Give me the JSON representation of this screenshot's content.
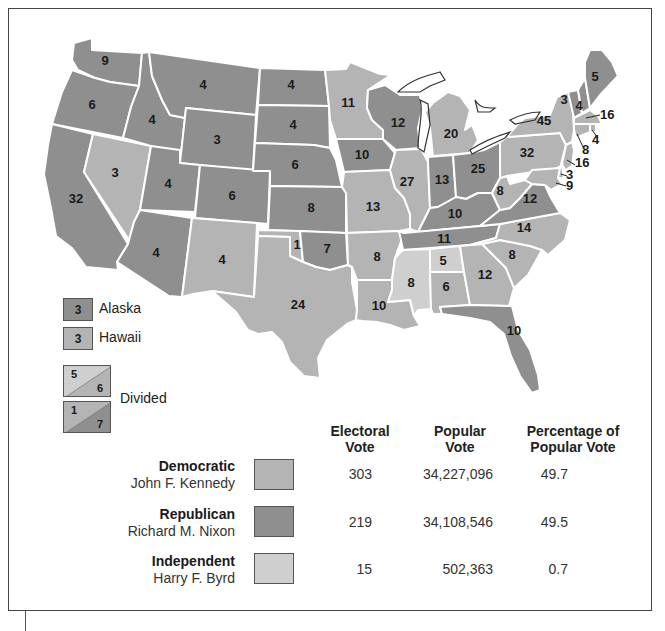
{
  "colors": {
    "democratic": "#b4b4b4",
    "republican": "#8f8f8f",
    "independent": "#d0d0d0",
    "border": "#ffffff",
    "outline": "#333333"
  },
  "map": {
    "states": [
      {
        "abbr": "WA",
        "ev": "9",
        "party": "republican"
      },
      {
        "abbr": "OR",
        "ev": "6",
        "party": "republican"
      },
      {
        "abbr": "CA",
        "ev": "32",
        "party": "republican"
      },
      {
        "abbr": "NV",
        "ev": "3",
        "party": "democratic"
      },
      {
        "abbr": "ID",
        "ev": "4",
        "party": "republican"
      },
      {
        "abbr": "MT",
        "ev": "4",
        "party": "republican"
      },
      {
        "abbr": "WY",
        "ev": "3",
        "party": "republican"
      },
      {
        "abbr": "UT",
        "ev": "4",
        "party": "republican"
      },
      {
        "abbr": "AZ",
        "ev": "4",
        "party": "republican"
      },
      {
        "abbr": "CO",
        "ev": "6",
        "party": "republican"
      },
      {
        "abbr": "NM",
        "ev": "4",
        "party": "democratic"
      },
      {
        "abbr": "ND",
        "ev": "4",
        "party": "republican"
      },
      {
        "abbr": "SD",
        "ev": "4",
        "party": "republican"
      },
      {
        "abbr": "NE",
        "ev": "6",
        "party": "republican"
      },
      {
        "abbr": "KS",
        "ev": "8",
        "party": "republican"
      },
      {
        "abbr": "OK",
        "ev": "7",
        "party": "republican",
        "split": "1"
      },
      {
        "abbr": "TX",
        "ev": "24",
        "party": "democratic"
      },
      {
        "abbr": "MN",
        "ev": "11",
        "party": "democratic"
      },
      {
        "abbr": "IA",
        "ev": "10",
        "party": "republican"
      },
      {
        "abbr": "MO",
        "ev": "13",
        "party": "democratic"
      },
      {
        "abbr": "AR",
        "ev": "8",
        "party": "democratic"
      },
      {
        "abbr": "LA",
        "ev": "10",
        "party": "democratic"
      },
      {
        "abbr": "WI",
        "ev": "12",
        "party": "republican"
      },
      {
        "abbr": "IL",
        "ev": "27",
        "party": "democratic"
      },
      {
        "abbr": "MI",
        "ev": "20",
        "party": "democratic"
      },
      {
        "abbr": "IN",
        "ev": "13",
        "party": "republican"
      },
      {
        "abbr": "OH",
        "ev": "25",
        "party": "republican"
      },
      {
        "abbr": "KY",
        "ev": "10",
        "party": "republican"
      },
      {
        "abbr": "TN",
        "ev": "11",
        "party": "republican"
      },
      {
        "abbr": "MS",
        "ev": "8",
        "party": "independent"
      },
      {
        "abbr": "AL",
        "ev": "5/6",
        "party": "divided"
      },
      {
        "abbr": "GA",
        "ev": "12",
        "party": "democratic"
      },
      {
        "abbr": "FL",
        "ev": "10",
        "party": "republican"
      },
      {
        "abbr": "SC",
        "ev": "8",
        "party": "democratic"
      },
      {
        "abbr": "NC",
        "ev": "14",
        "party": "democratic"
      },
      {
        "abbr": "VA",
        "ev": "12",
        "party": "republican"
      },
      {
        "abbr": "WV",
        "ev": "8",
        "party": "democratic"
      },
      {
        "abbr": "PA",
        "ev": "32",
        "party": "democratic"
      },
      {
        "abbr": "NY",
        "ev": "45",
        "party": "democratic"
      },
      {
        "abbr": "VT",
        "ev": "3",
        "party": "republican"
      },
      {
        "abbr": "NH",
        "ev": "4",
        "party": "republican"
      },
      {
        "abbr": "ME",
        "ev": "5",
        "party": "republican"
      },
      {
        "abbr": "MA",
        "ev": "16",
        "party": "democratic"
      },
      {
        "abbr": "RI",
        "ev": "4",
        "party": "democratic"
      },
      {
        "abbr": "CT",
        "ev": "8",
        "party": "democratic"
      },
      {
        "abbr": "NJ",
        "ev": "16",
        "party": "democratic"
      },
      {
        "abbr": "DE",
        "ev": "3",
        "party": "democratic"
      },
      {
        "abbr": "MD",
        "ev": "9",
        "party": "democratic"
      }
    ],
    "labels": {
      "WA": "9",
      "OR": "6",
      "CA": "32",
      "NV": "3",
      "ID": "4",
      "MT": "4",
      "WY": "3",
      "UT": "4",
      "AZ": "4",
      "CO": "6",
      "NM": "4",
      "ND": "4",
      "SD": "4",
      "NE": "6",
      "KS": "8",
      "OK": "7",
      "OK_split": "1",
      "TX": "24",
      "MN": "11",
      "IA": "10",
      "MO": "13",
      "AR": "8",
      "LA": "10",
      "WI": "12",
      "IL": "27",
      "MI": "20",
      "IN": "13",
      "OH": "25",
      "KY": "10",
      "TN": "11",
      "MS": "8",
      "AL_top": "5",
      "AL_bottom": "6",
      "GA": "12",
      "FL": "10",
      "SC": "8",
      "NC": "14",
      "VA": "12",
      "WV": "8",
      "PA": "32",
      "NY": "45",
      "VT": "3",
      "NH": "4",
      "ME": "5",
      "MA": "16",
      "RI": "4",
      "CT": "8",
      "NJ": "16",
      "DE": "3",
      "MD": "9"
    }
  },
  "legend": {
    "alaska": {
      "value": "3",
      "label": "Alaska",
      "party": "republican"
    },
    "hawaii": {
      "value": "3",
      "label": "Hawaii",
      "party": "democratic"
    },
    "divided": {
      "label": "Divided",
      "box1": {
        "top": "5",
        "bottom": "6"
      },
      "box2": {
        "top": "1",
        "bottom": "7"
      }
    }
  },
  "results": {
    "headers": {
      "electoral_1": "Electoral",
      "electoral_2": "Vote",
      "popular_1": "Popular",
      "popular_2": "Vote",
      "pct_1": "Percentage of",
      "pct_2": "Popular Vote"
    },
    "rows": [
      {
        "party": "Democratic",
        "candidate": "John F. Kennedy",
        "electoral": "303",
        "popular": "34,227,096",
        "percent": "49.7"
      },
      {
        "party": "Republican",
        "candidate": "Richard M. Nixon",
        "electoral": "219",
        "popular": "34,108,546",
        "percent": "49.5"
      },
      {
        "party": "Independent",
        "candidate": "Harry F. Byrd",
        "electoral": "15",
        "popular": "502,363",
        "percent": "0.7"
      }
    ]
  }
}
